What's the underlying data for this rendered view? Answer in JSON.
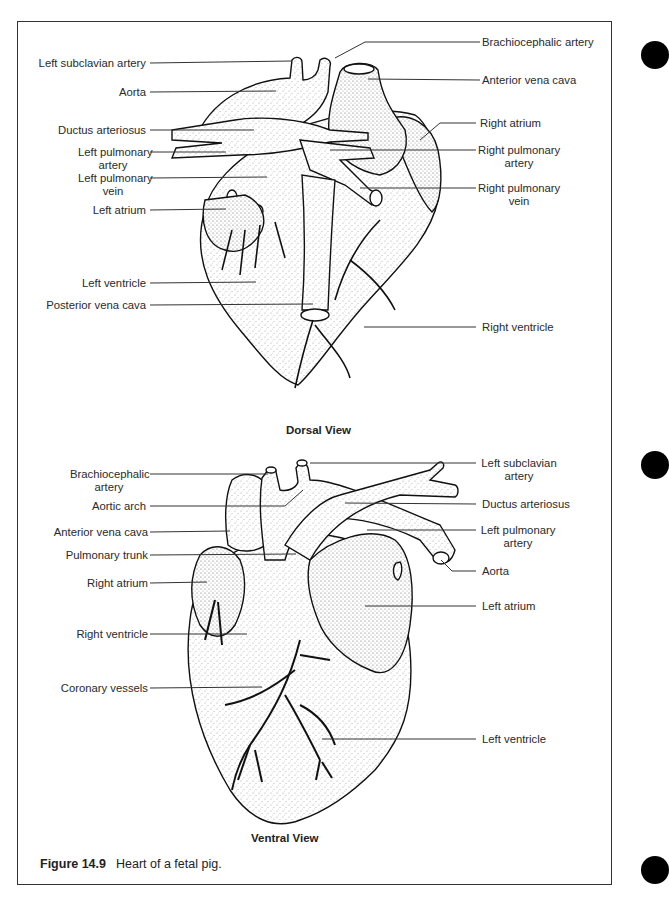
{
  "figure": {
    "number": "Figure 14.9",
    "caption": "Heart of a fetal pig."
  },
  "dorsal_view": {
    "title": "Dorsal View",
    "left_labels": [
      {
        "text": "Left subclavian artery",
        "lines": [
          "Left subclavian artery"
        ]
      },
      {
        "text": "Aorta",
        "lines": [
          "Aorta"
        ]
      },
      {
        "text": "Ductus arteriosus",
        "lines": [
          "Ductus arteriosus"
        ]
      },
      {
        "text": "Left pulmonary artery",
        "lines": [
          "Left pulmonary",
          "artery"
        ]
      },
      {
        "text": "Left pulmonary vein",
        "lines": [
          "Left pulmonary",
          "vein"
        ]
      },
      {
        "text": "Left atrium",
        "lines": [
          "Left atrium"
        ]
      },
      {
        "text": "Left ventricle",
        "lines": [
          "Left ventricle"
        ]
      },
      {
        "text": "Posterior vena cava",
        "lines": [
          "Posterior vena cava"
        ]
      }
    ],
    "right_labels": [
      {
        "text": "Brachiocephalic artery",
        "lines": [
          "Brachiocephalic artery"
        ]
      },
      {
        "text": "Anterior vena cava",
        "lines": [
          "Anterior vena cava"
        ]
      },
      {
        "text": "Right atrium",
        "lines": [
          "Right atrium"
        ]
      },
      {
        "text": "Right pulmonary artery",
        "lines": [
          "Right pulmonary",
          "artery"
        ]
      },
      {
        "text": "Right pulmonary vein",
        "lines": [
          "Right pulmonary",
          "vein"
        ]
      },
      {
        "text": "Right ventricle",
        "lines": [
          "Right ventricle"
        ]
      }
    ]
  },
  "ventral_view": {
    "title": "Ventral View",
    "left_labels": [
      {
        "text": "Brachiocephalic artery",
        "lines": [
          "Brachiocephalic",
          "artery"
        ]
      },
      {
        "text": "Aortic arch",
        "lines": [
          "Aortic arch"
        ]
      },
      {
        "text": "Anterior vena cava",
        "lines": [
          "Anterior vena cava"
        ]
      },
      {
        "text": "Pulmonary trunk",
        "lines": [
          "Pulmonary trunk"
        ]
      },
      {
        "text": "Right atrium",
        "lines": [
          "Right atrium"
        ]
      },
      {
        "text": "Right ventricle",
        "lines": [
          "Right ventricle"
        ]
      },
      {
        "text": "Coronary vessels",
        "lines": [
          "Coronary vessels"
        ]
      }
    ],
    "right_labels": [
      {
        "text": "Left subclavian artery",
        "lines": [
          "Left subclavian",
          "artery"
        ]
      },
      {
        "text": "Ductus arteriosus",
        "lines": [
          "Ductus arteriosus"
        ]
      },
      {
        "text": "Left pulmonary artery",
        "lines": [
          "Left pulmonary",
          "artery"
        ]
      },
      {
        "text": "Aorta",
        "lines": [
          "Aorta"
        ]
      },
      {
        "text": "Left atrium",
        "lines": [
          "Left atrium"
        ]
      },
      {
        "text": "Left ventricle",
        "lines": [
          "Left ventricle"
        ]
      }
    ]
  },
  "colors": {
    "ink": "#1a1a1a",
    "leader_line": "#333333",
    "stipple": "#555555",
    "background": "#ffffff",
    "punch_hole": "#000000"
  }
}
